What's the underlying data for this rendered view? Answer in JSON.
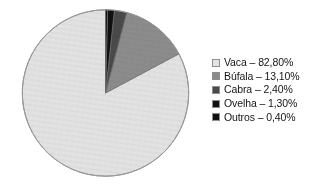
{
  "figure": {
    "name": "pie-chart-figure",
    "background_color": "#ffffff"
  },
  "chart_data": {
    "type": "pie",
    "title": "",
    "subtitle": "",
    "xlabel": "",
    "ylabel": "",
    "grid": false,
    "legend_position": "right",
    "value_unit": "%",
    "decimal_separator": ",",
    "start_angle_deg": 0,
    "direction": "counterclockwise",
    "categories": [
      "Vaca",
      "Búfala",
      "Cabra",
      "Ovelha",
      "Outros"
    ],
    "values": [
      82.8,
      13.1,
      2.4,
      1.3,
      0.4
    ],
    "value_labels": [
      "82,80%",
      "13,10%",
      "2,40%",
      "1,30%",
      "0,40%"
    ],
    "colors": [
      "#e2e2e2",
      "#8c8c8c",
      "#4a4a4a",
      "#101010",
      "#101010"
    ],
    "slices": [
      {
        "label": "Vaca",
        "value": 82.8,
        "value_label": "82,80%",
        "color": "#e2e2e2",
        "angle_deg": 298.08
      },
      {
        "label": "Búfala",
        "value": 13.1,
        "value_label": "13,10%",
        "color": "#8c8c8c",
        "angle_deg": 47.16
      },
      {
        "label": "Cabra",
        "value": 2.4,
        "value_label": "2,40%",
        "color": "#4a4a4a",
        "angle_deg": 8.64
      },
      {
        "label": "Ovelha",
        "value": 1.3,
        "value_label": "1,30%",
        "color": "#101010",
        "angle_deg": 4.68
      },
      {
        "label": "Outros",
        "value": 0.4,
        "value_label": "0,40%",
        "color": "#101010",
        "angle_deg": 1.44
      }
    ]
  },
  "legend": {
    "entries": [
      {
        "swatch_color": "#e2e2e2",
        "text": "Vaca – 82,80%"
      },
      {
        "swatch_color": "#8c8c8c",
        "text": "Búfala – 13,10%"
      },
      {
        "swatch_color": "#4a4a4a",
        "text": "Cabra – 2,40%"
      },
      {
        "swatch_color": "#101010",
        "text": "Ovelha – 1,30%"
      },
      {
        "swatch_color": "#101010",
        "text": "Outros – 0,40%"
      }
    ]
  }
}
